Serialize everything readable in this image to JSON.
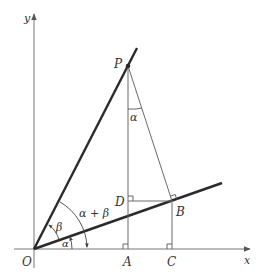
{
  "diagram": {
    "colors": {
      "background": "#ffffff",
      "thick_line": "#2a2a2a",
      "thin_line": "#6a6a6a",
      "axis": "#777777",
      "text": "#333333"
    },
    "axes": {
      "x_label": "x",
      "y_label": "y",
      "origin_label": "O"
    },
    "points": {
      "P": "P",
      "A": "A",
      "B": "B",
      "C": "C",
      "D": "D"
    },
    "angles": {
      "alpha_bottom": "α",
      "beta": "β",
      "alpha_plus_beta": "α + β",
      "alpha_at_P": "α"
    }
  }
}
